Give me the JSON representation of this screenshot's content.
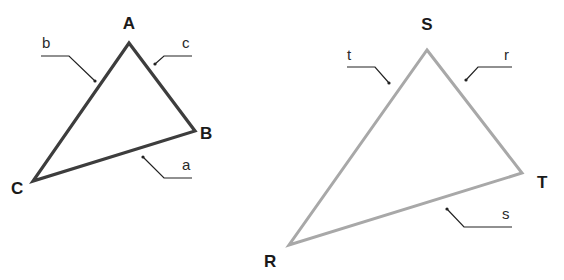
{
  "diagram": {
    "colors": {
      "triangle_abc_stroke": "#3d3d3d",
      "triangle_srt_stroke": "#a8a8a8",
      "leader": "#222222",
      "label": "#1a1a1a"
    },
    "triangle_abc": {
      "vertices": {
        "A": {
          "label": "A",
          "x": 129,
          "y": 43
        },
        "B": {
          "label": "B",
          "x": 195,
          "y": 131
        },
        "C": {
          "label": "C",
          "x": 33,
          "y": 181
        }
      },
      "sides": {
        "a": {
          "label": "a",
          "between": [
            "B",
            "C"
          ]
        },
        "b": {
          "label": "b",
          "between": [
            "A",
            "C"
          ]
        },
        "c": {
          "label": "c",
          "between": [
            "A",
            "B"
          ]
        }
      }
    },
    "triangle_srt": {
      "vertices": {
        "S": {
          "label": "S",
          "x": 427,
          "y": 50
        },
        "T": {
          "label": "T",
          "x": 522,
          "y": 173
        },
        "R": {
          "label": "R",
          "x": 289,
          "y": 245
        }
      },
      "sides": {
        "r": {
          "label": "r",
          "between": [
            "S",
            "T"
          ]
        },
        "s": {
          "label": "s",
          "between": [
            "R",
            "T"
          ]
        },
        "t": {
          "label": "t",
          "between": [
            "R",
            "S"
          ]
        }
      }
    }
  }
}
